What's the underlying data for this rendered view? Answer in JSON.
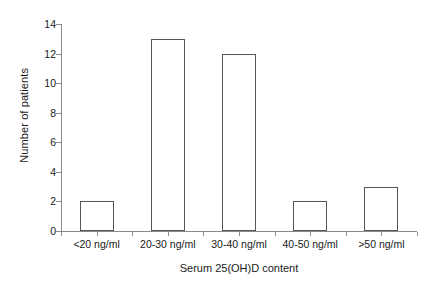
{
  "chart_data": {
    "type": "bar",
    "title": "",
    "categories": [
      "<20 ng/ml",
      "20-30 ng/ml",
      "30-40 ng/ml",
      "40-50 ng/ml",
      ">50 ng/ml"
    ],
    "values": [
      2,
      13,
      12,
      2,
      3
    ],
    "xlabel": "Serum 25(OH)D content",
    "ylabel": "Number of patients",
    "ylim": [
      0,
      14
    ],
    "ytick_labels": [
      "0",
      "2",
      "4",
      "6",
      "8",
      "10",
      "12",
      "14"
    ],
    "ytick_values": [
      0,
      2,
      4,
      6,
      8,
      10,
      12,
      14
    ],
    "grid": false,
    "legend": null,
    "bar_fill_color": "#ffffff",
    "bar_edge_color": "#555555",
    "axis_color": "#8a8a8a",
    "background_color": "#ffffff",
    "text_color": "#1a1a1a"
  }
}
